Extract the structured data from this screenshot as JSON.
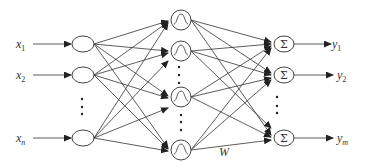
{
  "diagram": {
    "type": "neural-network",
    "colors": {
      "stroke": "#333333",
      "background": "#ffffff"
    },
    "inputs": [
      {
        "label": "x",
        "sub": "1",
        "y": 44
      },
      {
        "label": "x",
        "sub": "2",
        "y": 75
      },
      {
        "label": "x",
        "sub": "n",
        "y": 138
      }
    ],
    "hidden": [
      {
        "symbol": "bell-curve",
        "y": 20
      },
      {
        "symbol": "bell-curve",
        "y": 51
      },
      {
        "symbol": "bell-curve",
        "y": 97
      },
      {
        "symbol": "bell-curve",
        "y": 150
      }
    ],
    "outputs": [
      {
        "symbol": "Σ",
        "label": "y",
        "sub": "1",
        "y": 44
      },
      {
        "symbol": "Σ",
        "label": "y",
        "sub": "2",
        "y": 75
      },
      {
        "symbol": "Σ",
        "label": "y",
        "sub": "m",
        "y": 138
      }
    ],
    "weight_label": "W",
    "ellipsis": "⋮"
  }
}
